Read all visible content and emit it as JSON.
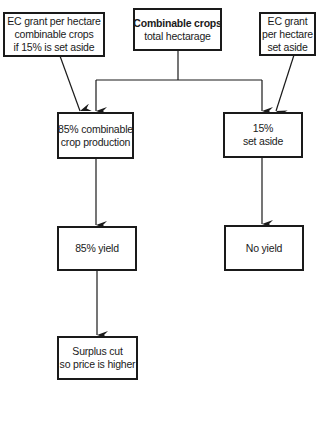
{
  "diagram": {
    "type": "flowchart",
    "nodes": [
      {
        "id": "ec_grant_combinable",
        "lines": [
          "EC grant per hectare",
          "combinable crops",
          "if 15% is set aside"
        ]
      },
      {
        "id": "combinable_total",
        "lines": [
          "Combinable crops",
          "total hectarage"
        ],
        "bold_first_line": true
      },
      {
        "id": "ec_grant_setaside",
        "lines": [
          "EC grant",
          "per hectare",
          "set aside"
        ]
      },
      {
        "id": "crop_production",
        "lines": [
          "85% combinable",
          "crop production"
        ]
      },
      {
        "id": "set_aside",
        "lines": [
          "15%",
          "set aside"
        ]
      },
      {
        "id": "yield_85",
        "lines": [
          "85% yield"
        ]
      },
      {
        "id": "no_yield",
        "lines": [
          "No yield"
        ]
      },
      {
        "id": "surplus_cut",
        "lines": [
          "Surplus cut",
          "so price is higher"
        ]
      }
    ],
    "edges": [
      {
        "from": "ec_grant_combinable",
        "to": "crop_production"
      },
      {
        "from": "combinable_total",
        "to": "crop_production"
      },
      {
        "from": "combinable_total",
        "to": "set_aside"
      },
      {
        "from": "ec_grant_setaside",
        "to": "set_aside"
      },
      {
        "from": "crop_production",
        "to": "yield_85"
      },
      {
        "from": "set_aside",
        "to": "no_yield"
      },
      {
        "from": "yield_85",
        "to": "surplus_cut"
      }
    ],
    "colors": {
      "line": "#1a1a1a",
      "background": "#ffffff"
    }
  }
}
